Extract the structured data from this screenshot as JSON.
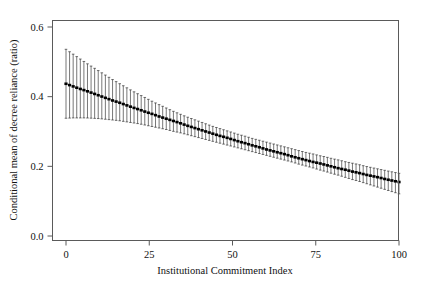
{
  "figure": {
    "background_color": "#ffffff",
    "line_color": "#1b1b1b",
    "frame_color": "#5a5a5a"
  },
  "axes": {
    "x_title": "Institutional Commitment Index",
    "y_title": "Conditional mean of decree reliance (ratio)",
    "x_ticks": [
      "0",
      "25",
      "50",
      "75",
      "100"
    ],
    "y_ticks": [
      "0.0",
      "0.2",
      "0.4",
      "0.6"
    ]
  },
  "chart_data": {
    "type": "line",
    "title": "",
    "subtitle": "",
    "xlabel": "Institutional Commitment Index",
    "ylabel": "Conditional mean of decree reliance (ratio)",
    "xlim": [
      0,
      100
    ],
    "ylim": [
      0.0,
      0.6
    ],
    "xticks": [
      0,
      25,
      50,
      75,
      100
    ],
    "yticks": [
      0.0,
      0.2,
      0.4,
      0.6
    ],
    "grid": false,
    "legend": null,
    "error_bar_style": "vertical-line-with-caps",
    "series": [
      {
        "name": "Conditional mean of decree reliance",
        "x": [
          0,
          2,
          4,
          6,
          8,
          10,
          12,
          14,
          16,
          18,
          20,
          22,
          24,
          26,
          28,
          30,
          32,
          34,
          36,
          38,
          40,
          42,
          44,
          46,
          48,
          50,
          52,
          54,
          56,
          58,
          60,
          62,
          64,
          66,
          68,
          70,
          72,
          74,
          76,
          78,
          80,
          82,
          84,
          86,
          88,
          90,
          92,
          94,
          96,
          98,
          100
        ],
        "values": [
          0.437,
          0.43,
          0.423,
          0.417,
          0.41,
          0.403,
          0.396,
          0.389,
          0.383,
          0.376,
          0.369,
          0.363,
          0.356,
          0.35,
          0.343,
          0.337,
          0.331,
          0.325,
          0.318,
          0.312,
          0.306,
          0.3,
          0.294,
          0.288,
          0.283,
          0.277,
          0.271,
          0.266,
          0.26,
          0.255,
          0.249,
          0.244,
          0.239,
          0.234,
          0.228,
          0.223,
          0.218,
          0.213,
          0.209,
          0.204,
          0.199,
          0.194,
          0.19,
          0.185,
          0.181,
          0.176,
          0.172,
          0.168,
          0.163,
          0.159,
          0.155
        ],
        "ci_lower": [
          0.338,
          0.339,
          0.339,
          0.339,
          0.338,
          0.337,
          0.335,
          0.333,
          0.331,
          0.328,
          0.325,
          0.322,
          0.318,
          0.314,
          0.31,
          0.306,
          0.301,
          0.297,
          0.292,
          0.287,
          0.282,
          0.277,
          0.272,
          0.267,
          0.262,
          0.257,
          0.252,
          0.247,
          0.242,
          0.237,
          0.232,
          0.227,
          0.222,
          0.217,
          0.212,
          0.206,
          0.201,
          0.196,
          0.19,
          0.185,
          0.179,
          0.174,
          0.168,
          0.162,
          0.157,
          0.151,
          0.145,
          0.139,
          0.133,
          0.127,
          0.121
        ],
        "ci_upper": [
          0.536,
          0.523,
          0.51,
          0.497,
          0.485,
          0.473,
          0.461,
          0.449,
          0.438,
          0.427,
          0.416,
          0.406,
          0.396,
          0.386,
          0.377,
          0.368,
          0.359,
          0.351,
          0.343,
          0.336,
          0.329,
          0.322,
          0.315,
          0.309,
          0.303,
          0.297,
          0.291,
          0.286,
          0.28,
          0.275,
          0.27,
          0.265,
          0.26,
          0.255,
          0.25,
          0.245,
          0.24,
          0.236,
          0.231,
          0.227,
          0.222,
          0.218,
          0.213,
          0.209,
          0.205,
          0.2,
          0.196,
          0.192,
          0.188,
          0.184,
          0.18
        ]
      }
    ],
    "n_error_bars": 94
  }
}
